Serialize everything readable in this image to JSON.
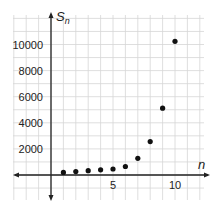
{
  "chart_data": {
    "type": "scatter",
    "title": "",
    "xlabel": "n",
    "ylabel": "S",
    "ylabel_subscript": "n",
    "x": [
      1,
      2,
      3,
      4,
      5,
      6,
      7,
      8,
      9,
      10
    ],
    "y": [
      200,
      260,
      330,
      400,
      460,
      650,
      1280,
      2560,
      5120,
      10240
    ],
    "xlim": [
      -3,
      12
    ],
    "ylim": [
      -2000,
      12000
    ],
    "x_ticks": [
      5,
      10
    ],
    "x_tick_labels": [
      "5",
      "10"
    ],
    "y_ticks": [
      2000,
      4000,
      6000,
      8000,
      10000
    ],
    "y_tick_labels": [
      "2000",
      "4000",
      "6000",
      "8000",
      "10000"
    ],
    "grid": true,
    "grid_step_x": 1,
    "grid_step_y": 1000,
    "point_color": "#111111",
    "grid_color": "#d6d6d6",
    "axis_color": "#222222"
  }
}
